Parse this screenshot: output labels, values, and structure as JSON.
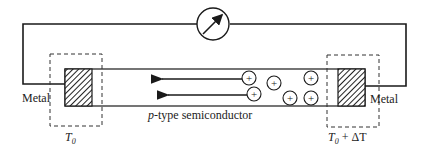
{
  "diagram": {
    "labels": {
      "metal_left": "Metal",
      "metal_right": "Metal",
      "semiconductor_prefix": "p",
      "semiconductor_suffix": "-type semiconductor",
      "temp_cold": "T",
      "temp_cold_sub": "0",
      "temp_hot": "T",
      "temp_hot_sub": "0",
      "temp_hot_rest": " + ΔT"
    },
    "meter": {
      "icon": "galvanometer-icon"
    },
    "carriers": {
      "symbol": "+",
      "count": 6
    },
    "colors": {
      "line": "#1a1a1a",
      "background": "#ffffff"
    }
  }
}
